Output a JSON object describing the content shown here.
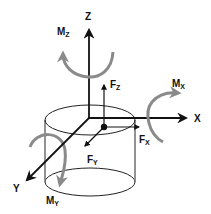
{
  "diagram": {
    "colors": {
      "axis": "#111111",
      "moment": "#8a8a8a",
      "outline": "#222222",
      "background": "#ffffff"
    },
    "axes": [
      {
        "id": "x",
        "label": "X"
      },
      {
        "id": "y",
        "label": "Y"
      },
      {
        "id": "z",
        "label": "Z"
      }
    ],
    "forces": [
      {
        "id": "fx",
        "base": "F",
        "sub": "X"
      },
      {
        "id": "fy",
        "base": "F",
        "sub": "Y"
      },
      {
        "id": "fz",
        "base": "F",
        "sub": "Z"
      }
    ],
    "moments": [
      {
        "id": "mx",
        "base": "M",
        "sub": "X"
      },
      {
        "id": "my",
        "base": "M",
        "sub": "Y"
      },
      {
        "id": "mz",
        "base": "M",
        "sub": "Z"
      }
    ],
    "shape": "cylinder"
  }
}
